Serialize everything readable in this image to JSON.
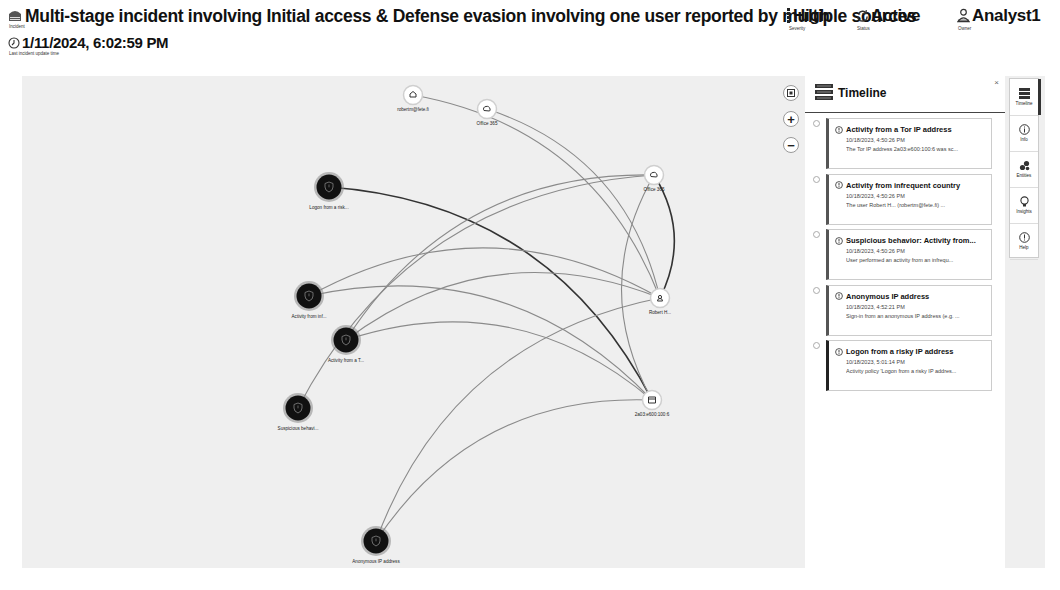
{
  "header": {
    "title": "Multi-stage incident involving Initial access & Defense evasion involving one user reported by multiple sources",
    "title_sublabel": "Incident",
    "severity": {
      "value": "High",
      "label": "Severity"
    },
    "status": {
      "value": "Active",
      "label": "Status"
    },
    "owner": {
      "value": "Analyst1",
      "label": "Owner"
    },
    "last_update": {
      "value": "1/11/2024, 6:02:59 PM",
      "label": "Last incident update time"
    }
  },
  "graph": {
    "zoom_controls": {
      "fit": "fit-view",
      "zoom_in": "+",
      "zoom_out": "−"
    },
    "nodes": [
      {
        "id": "n_logon",
        "type": "alert",
        "label": "Logon from a risk...",
        "x": 329,
        "y": 187
      },
      {
        "id": "n_infreq",
        "type": "alert",
        "label": "Activity from inf...",
        "x": 309,
        "y": 296
      },
      {
        "id": "n_tor",
        "type": "alert",
        "label": "Activity from a T...",
        "x": 346,
        "y": 340
      },
      {
        "id": "n_susp",
        "type": "alert",
        "label": "Suspicious behavi...",
        "x": 298,
        "y": 408
      },
      {
        "id": "n_anon",
        "type": "alert",
        "label": "Anonymous IP address",
        "x": 376,
        "y": 541
      },
      {
        "id": "n_mailbox",
        "type": "mailbox",
        "label": "robertm@fete.fi",
        "x": 413,
        "y": 95
      },
      {
        "id": "n_o365a",
        "type": "cloud-app",
        "label": "Office 365",
        "x": 487,
        "y": 109
      },
      {
        "id": "n_o365b",
        "type": "cloud-app",
        "label": "Office 365",
        "x": 654,
        "y": 175
      },
      {
        "id": "n_user",
        "type": "user",
        "label": "Robert H...",
        "x": 660,
        "y": 298
      },
      {
        "id": "n_ip",
        "type": "ip",
        "label": "2a03:e600:100:6",
        "x": 652,
        "y": 400
      }
    ],
    "edges": [
      {
        "from": "n_logon",
        "to": "n_ip",
        "strong": true
      },
      {
        "from": "n_mailbox",
        "to": "n_user",
        "strong": false
      },
      {
        "from": "n_o365a",
        "to": "n_user",
        "strong": false
      },
      {
        "from": "n_o365b",
        "to": "n_user",
        "strong": true
      },
      {
        "from": "n_o365b",
        "to": "n_ip",
        "strong": false
      },
      {
        "from": "n_o365b",
        "to": "n_tor",
        "strong": false
      },
      {
        "from": "n_infreq",
        "to": "n_ip",
        "strong": false
      },
      {
        "from": "n_infreq",
        "to": "n_user",
        "strong": false
      },
      {
        "from": "n_tor",
        "to": "n_user",
        "strong": false
      },
      {
        "from": "n_tor",
        "to": "n_ip",
        "strong": false
      },
      {
        "from": "n_susp",
        "to": "n_o365b",
        "strong": false
      },
      {
        "from": "n_anon",
        "to": "n_ip",
        "strong": false
      },
      {
        "from": "n_anon",
        "to": "n_user",
        "strong": false
      }
    ]
  },
  "timeline": {
    "title": "Timeline",
    "close": "×",
    "items": [
      {
        "title": "Activity from a Tor IP address",
        "date": "10/18/2023, 4:50:26 PM",
        "summary": "The Tor IP address 2a03:e600:100:6 was sc..."
      },
      {
        "title": "Activity from infrequent country",
        "date": "10/18/2023, 4:50:26 PM",
        "summary": "The user Robert H...       (robertm@fete.fi) ..."
      },
      {
        "title": "Suspicious behavior: Activity from...",
        "date": "10/18/2023, 4:50:26 PM",
        "summary": "User performed an activity from an infrequ..."
      },
      {
        "title": "Anonymous IP address",
        "date": "10/18/2023, 4:52:21 PM",
        "summary": "Sign-in from an anonymous IP address (e.g. ..."
      },
      {
        "title": "Logon from a risky IP address",
        "date": "10/18/2023, 5:01:14 PM",
        "summary": "Activity policy 'Logon from a risky IP addres..."
      }
    ]
  },
  "rail": {
    "items": [
      {
        "label": "Timeline",
        "icon": "timeline-icon",
        "active": true
      },
      {
        "label": "Info",
        "icon": "info-icon",
        "active": false
      },
      {
        "label": "Entities",
        "icon": "entities-icon",
        "active": false
      },
      {
        "label": "Insights",
        "icon": "lightbulb-icon",
        "active": false
      },
      {
        "label": "Help",
        "icon": "help-icon",
        "active": false
      }
    ]
  }
}
